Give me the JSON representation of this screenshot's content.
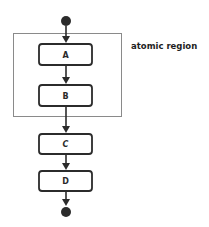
{
  "diagram": {
    "type": "activity-flow",
    "region": {
      "label": "atomic region",
      "border_color": "#8a8a8a",
      "contains": [
        "A",
        "B"
      ]
    },
    "start_node": "start-dot",
    "end_node": "end-dot",
    "nodes": [
      {
        "id": "A",
        "label": "A"
      },
      {
        "id": "B",
        "label": "B"
      },
      {
        "id": "C",
        "label": "C"
      },
      {
        "id": "D",
        "label": "D"
      }
    ],
    "edges": [
      [
        "start",
        "A"
      ],
      [
        "A",
        "B"
      ],
      [
        "B",
        "C"
      ],
      [
        "C",
        "D"
      ],
      [
        "D",
        "end"
      ]
    ],
    "colors": {
      "stroke": "#2b2b2b",
      "dot": "#2b2b2b",
      "background": "#ffffff"
    }
  }
}
